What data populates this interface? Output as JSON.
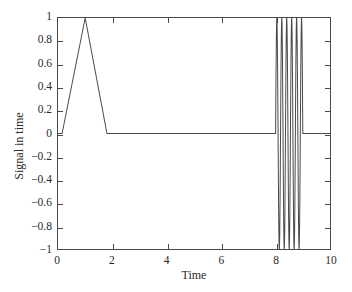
{
  "chart_data": {
    "type": "line",
    "title": "",
    "xlabel": "Time",
    "ylabel": "Signal in time",
    "xlim": [
      0,
      10
    ],
    "ylim": [
      -1,
      1
    ],
    "grid": false,
    "legend": null,
    "xticks": [
      0,
      2,
      4,
      6,
      8,
      10
    ],
    "xticklabels": [
      "0",
      "2",
      "4",
      "6",
      "8",
      "10"
    ],
    "yticks": [
      -1,
      -0.8,
      -0.6,
      -0.4,
      -0.2,
      0,
      0.2,
      0.4,
      0.6,
      0.8,
      1
    ],
    "yticklabels": [
      "−1",
      "−0.8",
      "−0.6",
      "−0.4",
      "−0.2",
      "0",
      "0.2",
      "0.4",
      "0.6",
      "0.8",
      "1"
    ],
    "line_color": "#4a4a4a",
    "line_width": 1,
    "series": [
      {
        "name": "signal",
        "description": "Triangular pulse from t=0.15 to t=1.8 peaking at 1 at t=1, zero baseline, then a high-frequency sinusoidal burst of amplitude 1 between t=8 and t=9, then zero to t=10.",
        "components": [
          {
            "kind": "triangle-pulse",
            "t_start": 0.15,
            "t_peak": 1.0,
            "t_end": 1.8,
            "peak_value": 1.0,
            "base_value": 0.0
          },
          {
            "kind": "zero-baseline",
            "t_start": 1.8,
            "t_end": 8.0,
            "value": 0.0
          },
          {
            "kind": "sinusoid-burst",
            "t_start": 8.0,
            "t_end": 9.0,
            "amplitude": 1.0,
            "cycles": 5.5,
            "phase": 0.0
          },
          {
            "kind": "zero-baseline",
            "t_start": 9.0,
            "t_end": 10.0,
            "value": 0.0
          }
        ]
      }
    ]
  },
  "figure": {
    "background_color": "#ffffff",
    "axis_color": "#4a4a4a"
  }
}
